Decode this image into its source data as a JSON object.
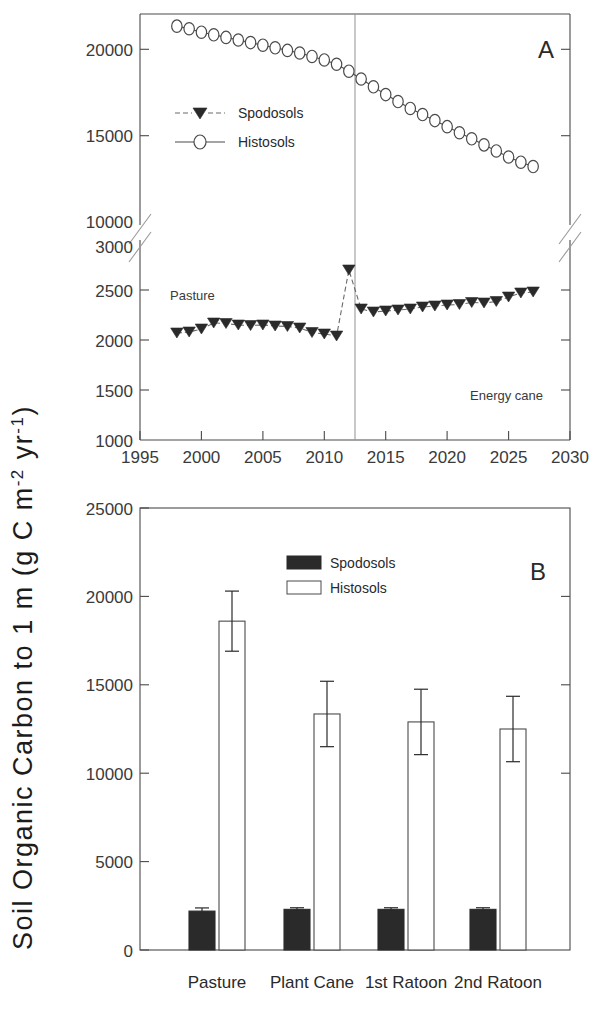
{
  "figure": {
    "y_axis_title_main": "Soil Organic Carbon to 1 m (g C m",
    "y_axis_title_sup1": "-2",
    "y_axis_title_mid": " yr",
    "y_axis_title_sup2": "-1",
    "y_axis_title_end": ")",
    "y_axis_title_full": "Soil Organic Carbon to 1 m (g C m-2 yr-1)"
  },
  "panel_a": {
    "letter": "A",
    "annotation_left": "Pasture",
    "annotation_right": "Energy cane",
    "legend": [
      {
        "label": "Spodosols",
        "marker": "filled-down-triangle",
        "line": "dashed",
        "color": "#2a2a2a"
      },
      {
        "label": "Histosols",
        "marker": "open-circle",
        "line": "solid",
        "color": "#2a2a2a"
      }
    ],
    "divider_year": 2012.5,
    "x_ticks": [
      1995,
      2000,
      2005,
      2010,
      2015,
      2020,
      2025,
      2030
    ],
    "y_ticks_upper": [
      15000,
      20000
    ],
    "y_ticks_lower": [
      1000,
      1500,
      2000,
      2500,
      3000
    ],
    "axis_break": true
  },
  "panel_b": {
    "letter": "B",
    "legend": [
      {
        "label": "Spodosols",
        "swatch": "filled"
      },
      {
        "label": "Histosols",
        "swatch": "open"
      }
    ],
    "y_ticks": [
      0,
      5000,
      10000,
      15000,
      20000,
      25000
    ],
    "categories": [
      "Pasture",
      "Plant Cane",
      "1st Ratoon",
      "2nd Ratoon"
    ]
  },
  "chart_data": [
    {
      "type": "line",
      "panel": "A",
      "title": "",
      "xlabel": "",
      "ylabel": "Soil Organic Carbon to 1 m (g C m-2 yr-1)",
      "xlim": [
        1995,
        2030
      ],
      "broken_y_axis": {
        "lower_segment": [
          1000,
          3000
        ],
        "upper_segment": [
          10000,
          22000
        ],
        "break_between": [
          3000,
          10000
        ]
      },
      "grid": false,
      "legend_position": "upper-left-inside",
      "annotations": [
        {
          "text": "Pasture",
          "x": 1999.5,
          "segment": "lower"
        },
        {
          "text": "Energy cane",
          "x": 2024.5,
          "segment": "lower"
        },
        {
          "text": "A",
          "x": 2028,
          "segment": "upper"
        }
      ],
      "vertical_divider_x": 2012.5,
      "x": [
        1998,
        1999,
        2000,
        2001,
        2002,
        2003,
        2004,
        2005,
        2006,
        2007,
        2008,
        2009,
        2010,
        2011,
        2012,
        2013,
        2014,
        2015,
        2016,
        2017,
        2018,
        2019,
        2020,
        2021,
        2022,
        2023,
        2024,
        2025,
        2026,
        2027
      ],
      "series": [
        {
          "name": "Histosols",
          "marker": "open-circle",
          "linestyle": "solid",
          "values": [
            21300,
            21150,
            20950,
            20800,
            20650,
            20500,
            20350,
            20200,
            20050,
            19900,
            19750,
            19550,
            19350,
            19100,
            18700,
            18250,
            17800,
            17350,
            16950,
            16550,
            16200,
            15850,
            15500,
            15150,
            14800,
            14450,
            14100,
            13750,
            13450,
            13200
          ]
        },
        {
          "name": "Spodosols",
          "marker": "filled-down-triangle",
          "linestyle": "dashed",
          "values": [
            2070,
            2080,
            2110,
            2170,
            2165,
            2150,
            2145,
            2150,
            2140,
            2135,
            2120,
            2075,
            2060,
            2040,
            2700,
            2310,
            2280,
            2290,
            2300,
            2310,
            2330,
            2340,
            2350,
            2355,
            2375,
            2370,
            2385,
            2430,
            2470,
            2480
          ]
        }
      ]
    },
    {
      "type": "bar",
      "panel": "B",
      "title": "",
      "xlabel": "",
      "ylabel": "Soil Organic Carbon to 1 m (g C m-2 yr-1)",
      "ylim": [
        0,
        25000
      ],
      "grid": false,
      "legend_position": "upper-center",
      "categories": [
        "Pasture",
        "Plant Cane",
        "1st Ratoon",
        "2nd Ratoon"
      ],
      "annotations": [
        {
          "text": "B",
          "x": "upper-right"
        }
      ],
      "series": [
        {
          "name": "Spodosols",
          "fill": "filled",
          "values": [
            2200,
            2300,
            2300,
            2300
          ],
          "errors": [
            180,
            90,
            90,
            90
          ]
        },
        {
          "name": "Histosols",
          "fill": "open",
          "values": [
            18600,
            13350,
            12900,
            12500
          ],
          "errors": [
            1700,
            1850,
            1850,
            1850
          ]
        }
      ]
    }
  ]
}
